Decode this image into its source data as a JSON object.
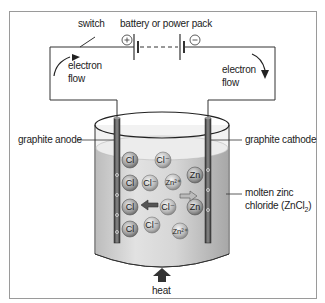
{
  "diagram": {
    "labels": {
      "switch": "switch",
      "battery": "battery or power pack",
      "plus": "+",
      "minus": "−",
      "electron_flow_left_1": "electron",
      "electron_flow_left_2": "flow",
      "electron_flow_right_1": "electron",
      "electron_flow_right_2": "flow",
      "anode": "graphite anode",
      "cathode": "graphite cathode",
      "electrolyte_1": "molten zinc",
      "electrolyte_2": "chloride (ZnCl",
      "electrolyte_sub": "2",
      "electrolyte_close": ")",
      "heat": "heat"
    },
    "ions": [
      {
        "text": "Cl",
        "type": "chlorine-atom"
      },
      {
        "text": "Cl⁻",
        "type": "chloride-ion"
      },
      {
        "text": "Cl",
        "type": "chlorine-atom"
      },
      {
        "text": "Cl⁻",
        "type": "chloride-ion"
      },
      {
        "text": "Zn²⁺",
        "type": "zinc-ion"
      },
      {
        "text": "Zn",
        "type": "zinc-atom"
      },
      {
        "text": "Cl",
        "type": "chlorine-atom"
      },
      {
        "text": "Cl⁻",
        "type": "chloride-ion"
      },
      {
        "text": "Zn",
        "type": "zinc-atom"
      },
      {
        "text": "Cl",
        "type": "chlorine-atom"
      },
      {
        "text": "Cl⁻",
        "type": "chloride-ion"
      },
      {
        "text": "Zn²⁺",
        "type": "zinc-ion"
      }
    ],
    "colors": {
      "wire": "#333333",
      "liquid": "#d9d9d9",
      "electrode": "#555555",
      "arrow": "#444444"
    }
  }
}
